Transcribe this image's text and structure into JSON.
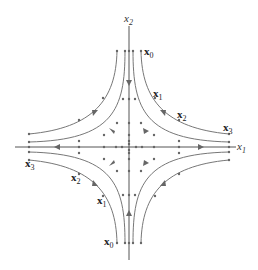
{
  "figure": {
    "type": "phase-portrait",
    "axes": {
      "horizontal_label": "x",
      "horizontal_sub": "1",
      "vertical_label": "x",
      "vertical_sub": "2"
    },
    "point_labels": {
      "upper_right": [
        {
          "base": "x",
          "sub": "0"
        },
        {
          "base": "x",
          "sub": "1"
        },
        {
          "base": "x",
          "sub": "2"
        },
        {
          "base": "x",
          "sub": "3"
        }
      ],
      "lower_left": [
        {
          "base": "x",
          "sub": "0"
        },
        {
          "base": "x",
          "sub": "1"
        },
        {
          "base": "x",
          "sub": "2"
        },
        {
          "base": "x",
          "sub": "3"
        }
      ]
    },
    "colors": {
      "axis": "#555555",
      "trajectory": "#777777",
      "text": "#222222"
    }
  }
}
